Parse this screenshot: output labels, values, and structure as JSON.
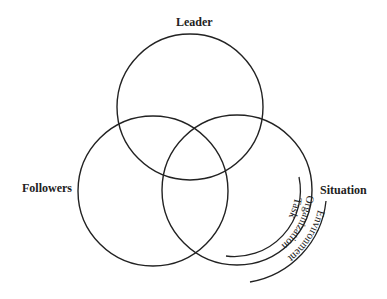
{
  "diagram": {
    "type": "venn",
    "circles": [
      {
        "label": "Leader"
      },
      {
        "label": "Followers"
      },
      {
        "label": "Situation"
      }
    ],
    "situation_arcs": [
      "Task",
      "Organization",
      "Environment"
    ]
  }
}
